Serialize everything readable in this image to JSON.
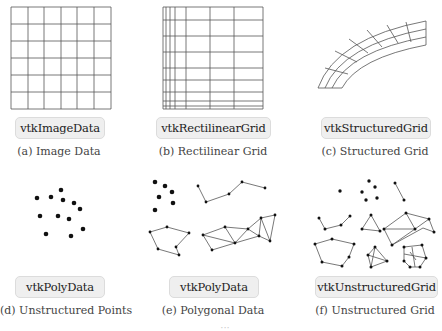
{
  "panels": [
    {
      "id": "a",
      "class_label": "vtkImageData",
      "caption": "(a) Image Data"
    },
    {
      "id": "b",
      "class_label": "vtkRectilinearGrid",
      "caption": "(b) Rectilinear Grid"
    },
    {
      "id": "c",
      "class_label": "vtkStructuredGrid",
      "caption": "(c) Structured Grid"
    },
    {
      "id": "d",
      "class_label": "vtkPolyData",
      "caption": "(d) Unstructured Points"
    },
    {
      "id": "e",
      "class_label": "vtkPolyData",
      "caption": "(e) Polygonal Data"
    },
    {
      "id": "f",
      "class_label": "vtkUnstructuredGrid",
      "caption": "(f) Unstructured Grid"
    }
  ],
  "colors": {
    "line": "#555555",
    "point": "#111111",
    "label_bg": "#efefef",
    "label_border": "#dcdcdc"
  },
  "footer": {
    "text": "···"
  }
}
